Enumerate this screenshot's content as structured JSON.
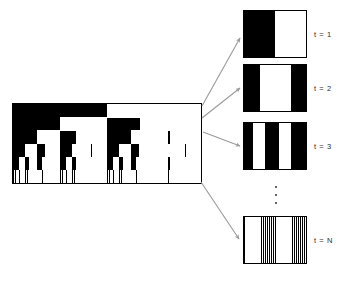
{
  "figure": {
    "title": "",
    "background_color": "#ffffff",
    "foreground_color": "#000000",
    "arrow_color": "#9a9a9a"
  },
  "tree_panel": {
    "name": "recursive-binary-tree-diagram",
    "description": "Black and white recursive binary subdivision (dyadic tree) pattern",
    "levels": 6,
    "fill_color": "#000000",
    "background_color": "#ffffff",
    "border_color": "#000000"
  },
  "scale_panels": [
    {
      "id": "t1",
      "label": "t = 1",
      "bands": [
        {
          "color": "#000000",
          "width_fraction": 0.5
        },
        {
          "color": "#ffffff",
          "width_fraction": 0.5
        }
      ],
      "band_count": 2
    },
    {
      "id": "t2",
      "label": "t = 2",
      "bands": [
        {
          "color": "#000000",
          "width_fraction": 0.25
        },
        {
          "color": "#ffffff",
          "width_fraction": 0.5
        },
        {
          "color": "#000000",
          "width_fraction": 0.25
        }
      ],
      "band_count": 3
    },
    {
      "id": "t3",
      "label": "t = 3",
      "bands": [
        {
          "color": "#000000",
          "width_fraction": 0.14
        },
        {
          "color": "#ffffff",
          "width_fraction": 0.2
        },
        {
          "color": "#000000",
          "width_fraction": 0.22
        },
        {
          "color": "#ffffff",
          "width_fraction": 0.2
        },
        {
          "color": "#000000",
          "width_fraction": 0.24
        }
      ],
      "band_count": 5
    },
    {
      "id": "tn",
      "label": "t = N",
      "bands": [],
      "band_count": 64,
      "pattern": "dense-alternating-vertical-stripes",
      "appearance": "gray"
    }
  ],
  "ellipsis": {
    "symbol": "vertical-ellipsis",
    "dot_count": 3
  },
  "arrows": [
    {
      "name": "arrow-to-t1",
      "from_x": 202,
      "from_y": 106,
      "to_x": 240,
      "to_y": 38
    },
    {
      "name": "arrow-to-t2",
      "from_x": 202,
      "from_y": 118,
      "to_x": 240,
      "to_y": 88
    },
    {
      "name": "arrow-to-t3",
      "from_x": 203,
      "from_y": 132,
      "to_x": 240,
      "to_y": 146
    },
    {
      "name": "arrow-to-tn",
      "from_x": 201,
      "from_y": 182,
      "to_x": 239,
      "to_y": 239
    }
  ]
}
